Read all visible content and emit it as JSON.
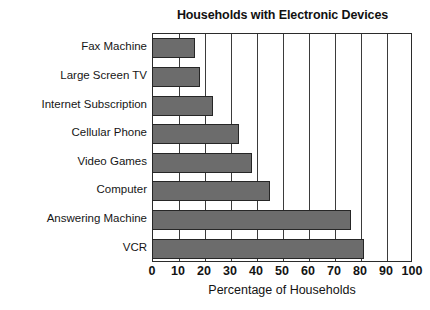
{
  "chart_data": {
    "type": "bar",
    "orientation": "horizontal",
    "title": "Households with Electronic Devices",
    "xlabel": "Percentage of Households",
    "ylabel": "",
    "categories": [
      "Fax Machine",
      "Large Screen TV",
      "Internet Subscription",
      "Cellular Phone",
      "Video Games",
      "Computer",
      "Answering Machine",
      "VCR"
    ],
    "values": [
      16,
      18,
      23,
      33,
      38,
      45,
      76,
      81
    ],
    "xlim": [
      0,
      100
    ],
    "xticks": [
      0,
      10,
      20,
      30,
      40,
      50,
      60,
      70,
      80,
      90,
      100
    ],
    "xtick_labels": [
      "0",
      "10",
      "20",
      "30",
      "40",
      "50",
      "60",
      "70",
      "80",
      "90",
      "100"
    ],
    "grid": "vertical",
    "legend": "none",
    "bar_color": "#6c6c6c",
    "bar_edge_color": "#262626",
    "axis_color": "#2b2b2b",
    "background_color": "#ffffff"
  }
}
